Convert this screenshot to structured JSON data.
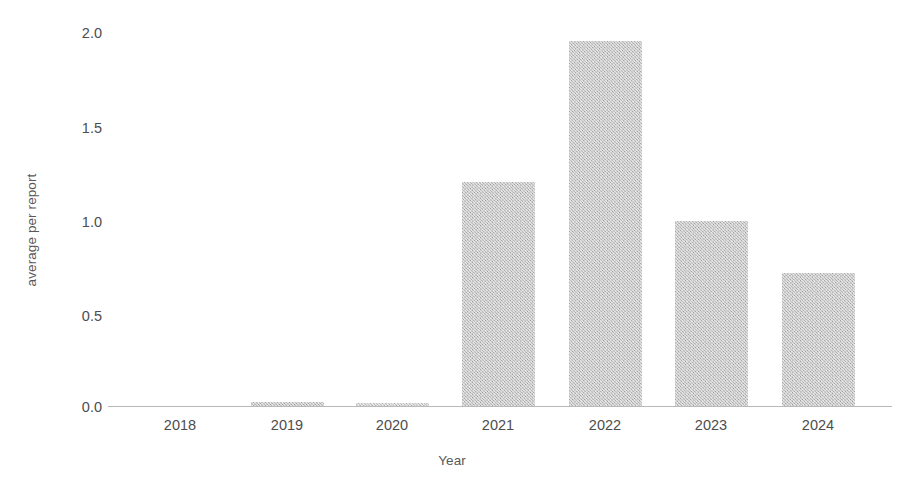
{
  "chart_data": {
    "type": "bar",
    "title": "",
    "subtitle": "",
    "xlabel": "Year",
    "ylabel": "average per report",
    "categories": [
      "2018",
      "2019",
      "2020",
      "2021",
      "2022",
      "2023",
      "2024"
    ],
    "values": [
      0.0,
      0.02,
      0.015,
      1.2,
      1.95,
      0.99,
      0.71
    ],
    "series": [
      {
        "name": "average per report",
        "values": [
          0.0,
          0.02,
          0.015,
          1.2,
          1.95,
          0.99,
          0.71
        ]
      }
    ],
    "ylim": [
      0.0,
      2.0
    ],
    "y_ticks": [
      "0.0",
      "0.5",
      "1.0",
      "1.5",
      "2.0"
    ],
    "y_tick_values": [
      0.0,
      0.5,
      1.0,
      1.5,
      2.0
    ],
    "x_ticks": [
      "2018",
      "2019",
      "2020",
      "2021",
      "2022",
      "2023",
      "2024"
    ],
    "grid": false,
    "legend": false,
    "legend_position": "none",
    "bar_color": "#b2b2b2",
    "axis_color": "#b9b9b9",
    "text_color": "#4d4d4d",
    "background_color": "#ffffff"
  },
  "axes": {
    "y_label": "average per report",
    "x_label": "Year",
    "y_tick_0": "0.0",
    "y_tick_1": "0.5",
    "y_tick_2": "1.0",
    "y_tick_3": "1.5",
    "y_tick_4": "2.0",
    "x_tick_0": "2018",
    "x_tick_1": "2019",
    "x_tick_2": "2020",
    "x_tick_3": "2021",
    "x_tick_4": "2022",
    "x_tick_5": "2023",
    "x_tick_6": "2024"
  }
}
